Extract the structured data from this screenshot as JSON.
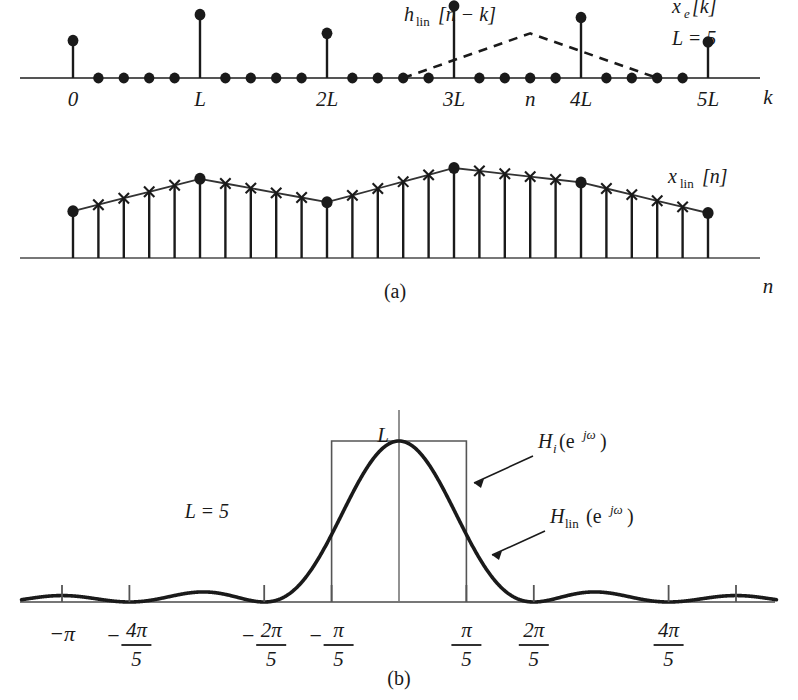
{
  "figure": {
    "caption_a": "(a)",
    "caption_b": "(b)",
    "colors": {
      "ink": "#1a1a1a",
      "axis": "#555555",
      "curve": "#1a1a1a",
      "box": "#555555"
    }
  },
  "panel_a": {
    "upper": {
      "signal_label": "x_e[k]",
      "signal_label_parts": {
        "base": "x",
        "sub": "e",
        "bracket": "[k]"
      },
      "param_label": "L = 5",
      "filter_label": "h_lin[n − k]",
      "filter_label_parts": {
        "base": "h",
        "sub": "lin",
        "bracket": "[n − k]"
      },
      "axis_label": "k",
      "tick_labels": [
        "0",
        "L",
        "2L",
        "3L",
        "n",
        "4L",
        "5L"
      ],
      "L": 5,
      "stem_values": [
        0.52,
        0.88,
        0.62,
        1.0,
        0.84,
        0.5
      ],
      "zero_sample_count_between": 4,
      "triangle_peak_label": "n"
    },
    "lower": {
      "signal_label": "x_lin[n]",
      "signal_label_parts": {
        "base": "x",
        "sub": "lin",
        "bracket": "[n]"
      },
      "axis_label": "n",
      "sample_marker_nonzero": "filled-circle",
      "sample_marker_interpolated": "cross",
      "values": [
        0.52,
        0.592,
        0.664,
        0.736,
        0.808,
        0.88,
        0.828,
        0.776,
        0.724,
        0.672,
        0.62,
        0.696,
        0.772,
        0.848,
        0.924,
        1.0,
        0.968,
        0.936,
        0.904,
        0.872,
        0.84,
        0.772,
        0.704,
        0.636,
        0.568,
        0.5
      ]
    }
  },
  "panel_b": {
    "param_label": "L = 5",
    "peak_label": "L",
    "ideal_filter_label": "H_i(e^{jω})",
    "ideal_filter_label_parts": {
      "base": "H",
      "sub": "i",
      "arg": "(e",
      "exp": "jω",
      "close": ")"
    },
    "linear_filter_label": "H_lin(e^{jω})",
    "linear_filter_label_parts": {
      "base": "H",
      "sub": "lin",
      "arg": "(e",
      "exp": "jω",
      "close": ")"
    },
    "tick_labels": [
      {
        "text": "−π",
        "kind": "plain",
        "omega": -1.0
      },
      {
        "text": "−4π/5",
        "kind": "fraction",
        "sign": "−",
        "num": "4π",
        "den": "5",
        "omega": -0.8
      },
      {
        "text": "−2π/5",
        "kind": "fraction",
        "sign": "−",
        "num": "2π",
        "den": "5",
        "omega": -0.4
      },
      {
        "text": "−π/5",
        "kind": "fraction",
        "sign": "−",
        "num": "π",
        "den": "5",
        "omega": -0.2
      },
      {
        "text": "π/5",
        "kind": "fraction",
        "sign": "",
        "num": "π",
        "den": "5",
        "omega": 0.2
      },
      {
        "text": "2π/5",
        "kind": "fraction",
        "sign": "",
        "num": "2π",
        "den": "5",
        "omega": 0.4
      },
      {
        "text": "4π/5",
        "kind": "fraction",
        "sign": "",
        "num": "4π",
        "den": "5",
        "omega": 0.8
      },
      {
        "text": "",
        "kind": "unlabeled",
        "omega": 1.0
      }
    ],
    "ideal_band_edges": [
      -0.2,
      0.2
    ],
    "ideal_height": 1.0
  },
  "chart_data": {
    "type": "line",
    "subcharts": [
      {
        "id": "a-upper",
        "type": "stem",
        "title": "x_e[k] with h_lin[n − k]",
        "xlabel": "k",
        "ylabel": "",
        "categories": [
          "0",
          "L",
          "2L",
          "3L",
          "4L",
          "5L"
        ],
        "values": [
          0.52,
          0.88,
          0.62,
          1.0,
          0.84,
          0.5
        ],
        "zeros_between": 4,
        "overlay": {
          "name": "h_lin[n − k]",
          "type": "triangle",
          "style": "dashed",
          "left_k": 13,
          "peak_k": 18,
          "right_k": 23,
          "peak_height": 0.62
        },
        "grid": false
      },
      {
        "id": "a-lower",
        "type": "stem",
        "title": "x_lin[n]",
        "xlabel": "n",
        "ylabel": "",
        "x": [
          0,
          1,
          2,
          3,
          4,
          5,
          6,
          7,
          8,
          9,
          10,
          11,
          12,
          13,
          14,
          15,
          16,
          17,
          18,
          19,
          20,
          21,
          22,
          23,
          24,
          25
        ],
        "values": [
          0.52,
          0.592,
          0.664,
          0.736,
          0.808,
          0.88,
          0.828,
          0.776,
          0.724,
          0.672,
          0.62,
          0.696,
          0.772,
          0.848,
          0.924,
          1.0,
          0.968,
          0.936,
          0.904,
          0.872,
          0.84,
          0.772,
          0.704,
          0.636,
          0.568,
          0.5
        ],
        "knots_at": [
          0,
          5,
          10,
          15,
          20,
          25
        ],
        "grid": false
      },
      {
        "id": "b",
        "type": "line",
        "title": "Frequency responses, L = 5",
        "xlabel": "ω",
        "ylabel": "",
        "xlim": [
          -1.15,
          1.15
        ],
        "ylim": [
          0,
          1.05
        ],
        "xtick_values": [
          -1.0,
          -0.8,
          -0.4,
          -0.2,
          0.2,
          0.4,
          0.8,
          1.0
        ],
        "xtick_labels": [
          "−π",
          "−4π/5",
          "−2π/5",
          "−π/5",
          "π/5",
          "2π/5",
          "4π/5",
          ""
        ],
        "series": [
          {
            "name": "H_lin(e^{jω})",
            "formula": "(1/L)*|sin(Lω/2)/sin(ω/2)|^2, normalized to peak L",
            "zeros_at": [
              -1.2,
              -0.8,
              -0.4,
              0.4,
              0.8,
              1.2
            ],
            "peak_value": 1.0,
            "sidelobe_peaks": [
              {
                "omega": -0.995,
                "value": 0.055
              },
              {
                "omega": -0.6,
                "value": 0.09
              },
              {
                "omega": 0.6,
                "value": 0.09
              },
              {
                "omega": 0.995,
                "value": 0.055
              }
            ],
            "style": "solid-thick"
          },
          {
            "name": "H_i(e^{jω})",
            "type": "rect",
            "band": [
              -0.2,
              0.2
            ],
            "height": 1.0,
            "style": "thin-box"
          }
        ],
        "annotations": [
          {
            "text": "L",
            "target": "peak"
          },
          {
            "text": "L = 5",
            "target": "left-area"
          }
        ],
        "grid": false
      }
    ]
  }
}
